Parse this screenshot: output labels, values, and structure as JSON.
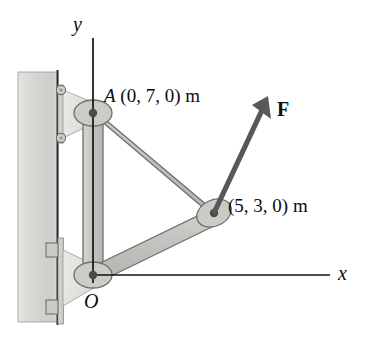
{
  "figure": {
    "background_color": "#ffffff"
  },
  "axes": {
    "y_label": "y",
    "x_label": "x",
    "origin_label": "O",
    "axis_color": "#111111"
  },
  "labels": {
    "point_a_name": "A",
    "point_a_coords": "(0, 7, 0) m",
    "point_b_coords": "(5, 3, 0) m",
    "force_label": "F"
  },
  "colors": {
    "wall": "#d6d6d2",
    "wall_edge": "#8e8e8a",
    "member_fill": "#c2c2be",
    "member_edge": "#6f6f6b",
    "gusset_fill": "#e2e2de",
    "pin_dot": "#4a4a4a",
    "force_arrow": "#585858",
    "plate": "#cfcfcb"
  },
  "geometry": {
    "point_o": "origin pin",
    "point_a": "upper pin joint",
    "point_b": "right lug joint",
    "force_direction": "up and to the right"
  }
}
